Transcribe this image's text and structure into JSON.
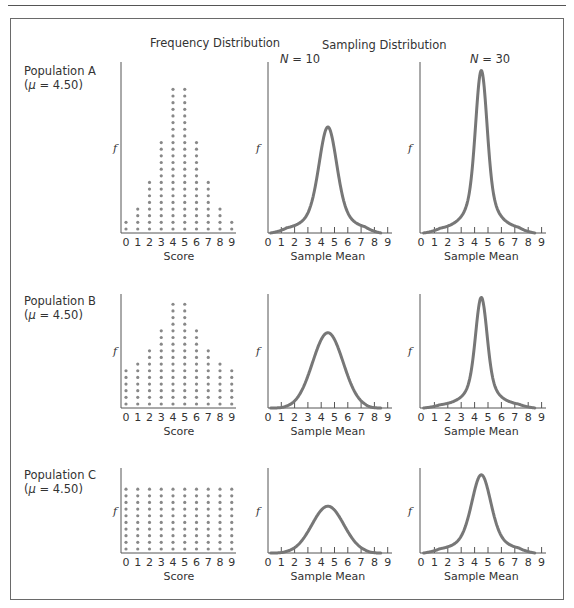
{
  "headers": {
    "frequency": "Frequency Distribution",
    "sampling": "Sampling Distribution",
    "n10_var": "N",
    "n10_rest": " = 10",
    "n30_var": "N",
    "n30_rest": " = 30"
  },
  "populations": [
    {
      "name": "Population A",
      "mu_open": "(",
      "mu_sym": "μ",
      "mu_rest": " = 4.50)"
    },
    {
      "name": "Population B",
      "mu_open": "(",
      "mu_sym": "μ",
      "mu_rest": " = 4.50)"
    },
    {
      "name": "Population C",
      "mu_open": "(",
      "mu_sym": "μ",
      "mu_rest": " = 4.50)"
    }
  ],
  "axis_labels": {
    "score": "Score",
    "sample_mean": "Sample Mean",
    "f": "f"
  },
  "chart_data": [
    {
      "type": "scatter",
      "title": "Population A — Frequency Distribution",
      "subtitle": "(μ = 4.50)",
      "xlabel": "Score",
      "ylabel": "f",
      "categories": [
        0,
        1,
        2,
        3,
        4,
        5,
        6,
        7,
        8,
        9
      ],
      "values": [
        2,
        4,
        8,
        14,
        22,
        22,
        14,
        8,
        4,
        2
      ],
      "style": "dot-plot"
    },
    {
      "type": "line",
      "title": "Population A — Sampling Distribution, N = 10",
      "xlabel": "Sample Mean",
      "ylabel": "f",
      "x_ticks": [
        0,
        1,
        2,
        3,
        4,
        5,
        6,
        7,
        8,
        9
      ],
      "peak_x": 4.5,
      "relative_peak": 0.62,
      "relative_width": 0.8,
      "shape": "peaked"
    },
    {
      "type": "line",
      "title": "Population A — Sampling Distribution, N = 30",
      "xlabel": "Sample Mean",
      "ylabel": "f",
      "x_ticks": [
        0,
        1,
        2,
        3,
        4,
        5,
        6,
        7,
        8,
        9
      ],
      "peak_x": 4.5,
      "relative_peak": 0.95,
      "relative_width": 0.6,
      "shape": "sharply peaked"
    },
    {
      "type": "scatter",
      "title": "Population B — Frequency Distribution",
      "subtitle": "(μ = 4.50)",
      "xlabel": "Score",
      "ylabel": "f",
      "categories": [
        0,
        1,
        2,
        3,
        4,
        5,
        6,
        7,
        8,
        9
      ],
      "values": [
        6,
        7,
        9,
        12,
        16,
        16,
        12,
        9,
        7,
        6
      ],
      "style": "dot-plot"
    },
    {
      "type": "line",
      "title": "Population B — Sampling Distribution, N = 10",
      "xlabel": "Sample Mean",
      "ylabel": "f",
      "x_ticks": [
        0,
        1,
        2,
        3,
        4,
        5,
        6,
        7,
        8,
        9
      ],
      "peak_x": 4.5,
      "relative_peak": 0.66,
      "relative_width": 1.15,
      "shape": "bell"
    },
    {
      "type": "line",
      "title": "Population B — Sampling Distribution, N = 30",
      "xlabel": "Sample Mean",
      "ylabel": "f",
      "x_ticks": [
        0,
        1,
        2,
        3,
        4,
        5,
        6,
        7,
        8,
        9
      ],
      "peak_x": 4.5,
      "relative_peak": 0.97,
      "relative_width": 0.6,
      "shape": "sharply peaked"
    },
    {
      "type": "scatter",
      "title": "Population C — Frequency Distribution",
      "subtitle": "(μ = 4.50)",
      "xlabel": "Score",
      "ylabel": "f",
      "categories": [
        0,
        1,
        2,
        3,
        4,
        5,
        6,
        7,
        8,
        9
      ],
      "values": [
        10,
        10,
        10,
        10,
        10,
        10,
        10,
        10,
        10,
        10
      ],
      "style": "dot-plot"
    },
    {
      "type": "line",
      "title": "Population C — Sampling Distribution, N = 10",
      "xlabel": "Sample Mean",
      "ylabel": "f",
      "x_ticks": [
        0,
        1,
        2,
        3,
        4,
        5,
        6,
        7,
        8,
        9
      ],
      "peak_x": 4.5,
      "relative_peak": 0.55,
      "relative_width": 1.2,
      "shape": "bell"
    },
    {
      "type": "line",
      "title": "Population C — Sampling Distribution, N = 30",
      "xlabel": "Sample Mean",
      "ylabel": "f",
      "x_ticks": [
        0,
        1,
        2,
        3,
        4,
        5,
        6,
        7,
        8,
        9
      ],
      "peak_x": 4.5,
      "relative_peak": 0.92,
      "relative_width": 0.85,
      "shape": "peaked"
    }
  ]
}
